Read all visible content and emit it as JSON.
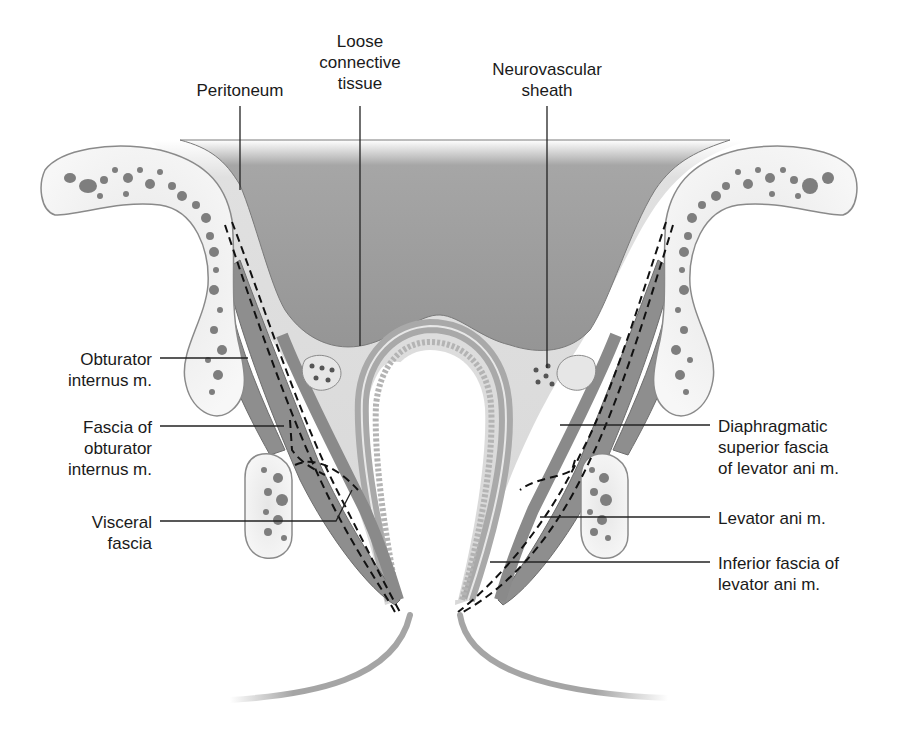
{
  "figure": {
    "colors": {
      "cavity": "#9a9a9a",
      "fascia_light": "#dcdcdc",
      "bone_fill": "#f2f2f2",
      "bone_outline": "#8a8a8a",
      "bone_pores": "#7a7a7a",
      "muscle": "#8c8c8c",
      "rectum_wall": "#a8a8a8",
      "leader_line": "#222222",
      "label_text": "#1a1a1a"
    }
  },
  "labels": {
    "peritoneum": "Peritoneum",
    "loose_connective_tissue": "Loose\nconnective\ntissue",
    "neurovascular_sheath": "Neurovascular\nsheath",
    "obturator_internus": "Obturator\ninternus m.",
    "fascia_obturator_internus": "Fascia of\nobturator\ninternus m.",
    "visceral_fascia": "Visceral\nfascia",
    "diaphragmatic_superior_fascia": "Diaphragmatic\nsuperior fascia\nof levator ani m.",
    "levator_ani": "Levator ani m.",
    "inferior_fascia": "Inferior fascia of\nlevator ani m."
  }
}
